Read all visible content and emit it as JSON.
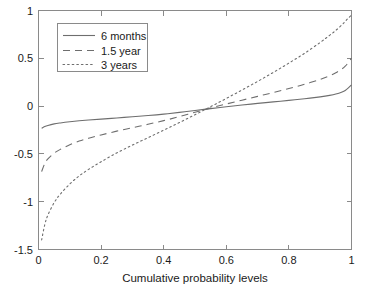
{
  "figure": {
    "background_color": "#ffffff",
    "frame_color": "#8a8a8a",
    "curve_color": "#6e6e6e",
    "text_color": "#1a1a1a"
  },
  "chart_data": {
    "type": "line",
    "title": "",
    "subtitle": "",
    "xlabel": "Cumulative probability levels",
    "ylabel": "",
    "xlim": [
      0,
      1
    ],
    "ylim": [
      -1.5,
      1
    ],
    "xticks": [
      0,
      0.2,
      0.4,
      0.6,
      0.8,
      1
    ],
    "xticklabels": [
      "0",
      "0.2",
      "0.4",
      "0.6",
      "0.8",
      "1"
    ],
    "yticks": [
      -1.5,
      -1,
      -0.5,
      0,
      0.5,
      1
    ],
    "yticklabels": [
      "-1.5",
      "-1",
      "-0.5",
      "0",
      "0.5",
      "1"
    ],
    "grid": false,
    "legend_position": "upper left",
    "legend_entries": [
      "6 months",
      "1.5 year",
      "3 years"
    ],
    "x": [
      0.01,
      0.02,
      0.03,
      0.05,
      0.07,
      0.1,
      0.13,
      0.16,
      0.2,
      0.25,
      0.3,
      0.35,
      0.4,
      0.45,
      0.5,
      0.55,
      0.6,
      0.65,
      0.7,
      0.75,
      0.8,
      0.85,
      0.9,
      0.93,
      0.95,
      0.97,
      0.98,
      0.99,
      1.0
    ],
    "series": [
      {
        "name": "6 months",
        "linestyle": "solid",
        "values": [
          -0.232,
          -0.214,
          -0.202,
          -0.186,
          -0.176,
          -0.164,
          -0.154,
          -0.146,
          -0.136,
          -0.124,
          -0.112,
          -0.099,
          -0.084,
          -0.066,
          -0.046,
          -0.026,
          -0.007,
          0.011,
          0.028,
          0.044,
          0.06,
          0.077,
          0.097,
          0.112,
          0.126,
          0.148,
          0.164,
          0.19,
          0.222
        ]
      },
      {
        "name": "1.5 year",
        "linestyle": "dashed",
        "values": [
          -0.685,
          -0.6,
          -0.552,
          -0.492,
          -0.452,
          -0.404,
          -0.366,
          -0.336,
          -0.302,
          -0.262,
          -0.226,
          -0.19,
          -0.152,
          -0.11,
          -0.064,
          -0.02,
          0.022,
          0.062,
          0.102,
          0.142,
          0.184,
          0.228,
          0.28,
          0.318,
          0.348,
          0.39,
          0.418,
          0.456,
          0.502
        ]
      },
      {
        "name": "3 years",
        "linestyle": "dotted",
        "values": [
          -1.4,
          -1.24,
          -1.14,
          -1.01,
          -0.92,
          -0.815,
          -0.73,
          -0.662,
          -0.582,
          -0.49,
          -0.408,
          -0.33,
          -0.252,
          -0.172,
          -0.09,
          -0.006,
          0.08,
          0.168,
          0.258,
          0.352,
          0.45,
          0.552,
          0.666,
          0.74,
          0.792,
          0.852,
          0.886,
          0.922,
          0.952
        ]
      }
    ]
  },
  "axis": {
    "x_title": "Cumulative probability levels"
  },
  "legend": {
    "items": [
      {
        "label": "6 months",
        "style": "solid"
      },
      {
        "label": "1.5 year",
        "style": "dashed"
      },
      {
        "label": "3 years",
        "style": "dotted"
      }
    ]
  }
}
